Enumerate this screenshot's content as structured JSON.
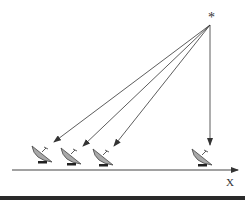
{
  "diagram": {
    "source_symbol": "*",
    "axis_label": "X",
    "antenna_count": 4,
    "ray_count": 4,
    "colors": {
      "line": "#333333",
      "dish": "#a9a9a9",
      "bar": "#2a2a2a"
    }
  }
}
